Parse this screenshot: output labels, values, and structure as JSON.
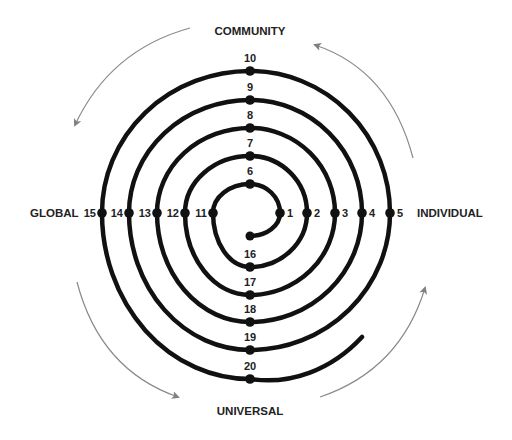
{
  "diagram": {
    "type": "spiral",
    "center": [
      250,
      213
    ],
    "colors": {
      "spiral": "#111111",
      "arrows": "#808080",
      "text": "#222222"
    },
    "directions": {
      "top": "COMMUNITY",
      "left": "GLOBAL",
      "right": "INDIVIDUAL",
      "bottom": "UNIVERSAL"
    },
    "spiral_start": [
      250,
      236
    ],
    "spiral_end": [
      362,
      337
    ],
    "points": [
      {
        "label": "1",
        "x": 280,
        "y": 213,
        "side": "right"
      },
      {
        "label": "2",
        "x": 307,
        "y": 213,
        "side": "right"
      },
      {
        "label": "3",
        "x": 335,
        "y": 213,
        "side": "right"
      },
      {
        "label": "4",
        "x": 362,
        "y": 213,
        "side": "right"
      },
      {
        "label": "5",
        "x": 390,
        "y": 213,
        "side": "right"
      },
      {
        "label": "6",
        "x": 250,
        "y": 184,
        "side": "top"
      },
      {
        "label": "7",
        "x": 250,
        "y": 156,
        "side": "top"
      },
      {
        "label": "8",
        "x": 250,
        "y": 128,
        "side": "top"
      },
      {
        "label": "9",
        "x": 250,
        "y": 100,
        "side": "top"
      },
      {
        "label": "10",
        "x": 250,
        "y": 71,
        "side": "top"
      },
      {
        "label": "11",
        "x": 213,
        "y": 213,
        "side": "left"
      },
      {
        "label": "12",
        "x": 185,
        "y": 213,
        "side": "left"
      },
      {
        "label": "13",
        "x": 157,
        "y": 213,
        "side": "left"
      },
      {
        "label": "14",
        "x": 129,
        "y": 213,
        "side": "left"
      },
      {
        "label": "15",
        "x": 102,
        "y": 213,
        "side": "left"
      },
      {
        "label": "16",
        "x": 250,
        "y": 267,
        "side": "bottom"
      },
      {
        "label": "17",
        "x": 250,
        "y": 295,
        "side": "bottom"
      },
      {
        "label": "18",
        "x": 250,
        "y": 322,
        "side": "bottom"
      },
      {
        "label": "19",
        "x": 250,
        "y": 350,
        "side": "bottom"
      },
      {
        "label": "20",
        "x": 250,
        "y": 379,
        "side": "bottom"
      }
    ]
  }
}
